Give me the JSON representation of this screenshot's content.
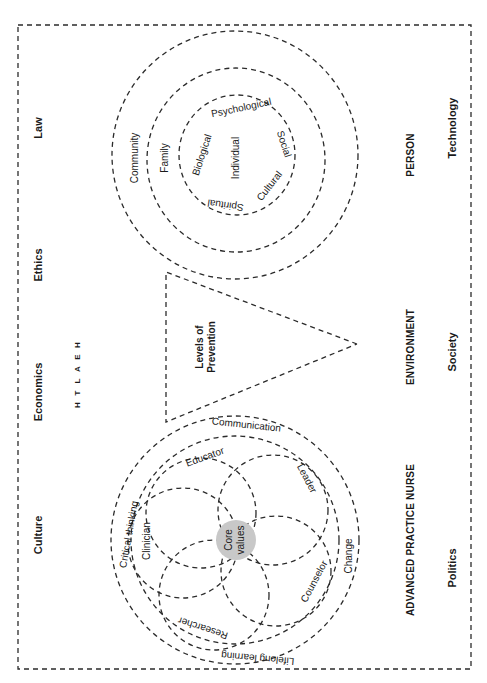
{
  "diagram": {
    "orientation": "rotated 90 degrees counter-clockwise (text reads bottom-to-top)",
    "context_factors": {
      "left_column": [
        "Law",
        "Ethics",
        "Economics",
        "Culture"
      ],
      "right_column": [
        "Technology",
        "Society",
        "Politics"
      ]
    },
    "health_label": [
      "H",
      "E",
      "A",
      "L",
      "T",
      "H"
    ],
    "person": {
      "title": "PERSON",
      "outer_ring": "Community",
      "middle_ring": "Family",
      "center": "Individual",
      "inner_ring_labels": [
        "Psychological",
        "Social",
        "Cultural",
        "Spiritual",
        "Biological"
      ]
    },
    "environment": {
      "title": "ENVIRONMENT",
      "triangle_label_line1": "Levels of",
      "triangle_label_line2": "Prevention"
    },
    "apn": {
      "title": "ADVANCED PRACTICE NURSE",
      "outer_ring_labels": [
        "Communication",
        "Change",
        "Lifelong learning",
        "Critical thinking"
      ],
      "petal_labels": [
        "Educator",
        "Leader",
        "Counselor",
        "Researcher",
        "Clinician"
      ],
      "core_line1": "Core",
      "core_line2": "values",
      "core_fill": "#c8c8c8"
    }
  }
}
